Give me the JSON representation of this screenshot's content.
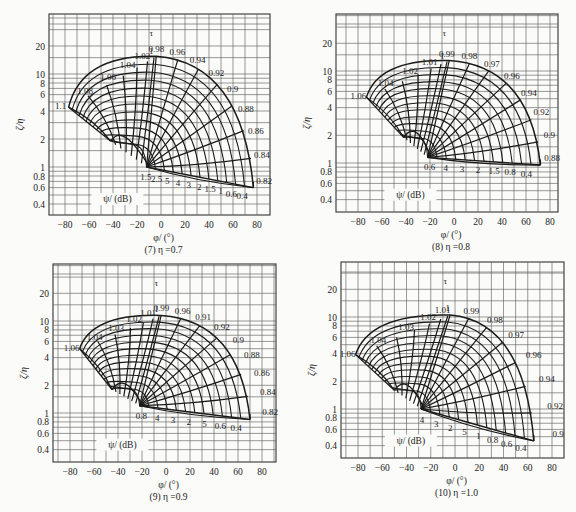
{
  "chart_data": [
    {
      "type": "nomogram",
      "title": "(7) η =0.7",
      "xlabel": "φ/ (°)",
      "ylabel": "ζ/η",
      "xticks": [
        -80,
        -60,
        -40,
        -20,
        0,
        20,
        40,
        60,
        80
      ],
      "yticks": [
        0.4,
        0.6,
        0.8,
        1,
        2,
        4,
        6,
        8,
        10,
        20
      ],
      "yscale": "log",
      "grid": true,
      "curve_family_label": "τ",
      "psi_label": "ψ/ (dB)",
      "tau_labels": [
        "1.1",
        "1.08",
        "1.06",
        "1.04",
        "1.02",
        "1",
        "0.98",
        "0.96",
        "0.94",
        "0.92",
        "0.9",
        "0.88",
        "0.86",
        "0.84",
        "0.82"
      ],
      "psi_labels": [
        "1.5",
        "2.5",
        "5",
        "4",
        "3",
        "2",
        "1.5",
        "1",
        "0.6",
        "0.4"
      ],
      "frame": {
        "x0": 49,
        "x1": 270,
        "y0": 14,
        "y1": 215
      },
      "xmap": {
        "v0": -80,
        "p0": 65,
        "v1": 80,
        "p1": 257
      },
      "ymap": {
        "v0": 1,
        "p0": 167,
        "per_decade": 93
      },
      "outer_arc": {
        "cx_deg": -2,
        "cy": 1.9,
        "top": 15.5,
        "left_deg": -77,
        "left_y": 4.4,
        "right_deg": 77,
        "right_y": 0.6
      },
      "inner_arc": {
        "left_deg": -42,
        "left_y": 1.9,
        "right_deg": -12,
        "right_y": 1.0
      },
      "bottom_edge": {
        "from_deg": -12,
        "from_y": 1.0,
        "to_deg": 77,
        "to_y": 0.6
      }
    },
    {
      "type": "nomogram",
      "title": "(8) η =0.8",
      "xlabel": "φ/ (°)",
      "ylabel": "ζ/η",
      "xticks": [
        -80,
        -60,
        -40,
        -20,
        0,
        20,
        40,
        60,
        80
      ],
      "yticks": [
        0.4,
        0.6,
        0.8,
        1,
        2,
        4,
        6,
        8,
        10,
        20
      ],
      "yscale": "log",
      "grid": true,
      "curve_family_label": "τ",
      "psi_label": "ψ/ (dB)",
      "tau_labels": [
        "1.06",
        "1.04",
        "1.02",
        "1.01",
        "1",
        "0.99",
        "0.98",
        "0.97",
        "0.96",
        "0.94",
        "0.92",
        "0.9",
        "0.88"
      ],
      "psi_labels": [
        "0.6",
        "4",
        "3",
        "2",
        "1.5",
        "0.8",
        "0.4"
      ],
      "frame": {
        "x0": 336,
        "x1": 558,
        "y0": 14,
        "y1": 212
      },
      "xmap": {
        "v0": -80,
        "p0": 358,
        "v1": 80,
        "p1": 550
      },
      "ymap": {
        "v0": 1,
        "p0": 163,
        "per_decade": 92
      },
      "outer_arc": {
        "top": 13,
        "left_deg": -73,
        "left_y": 5.2,
        "right_deg": 72,
        "right_y": 0.95
      },
      "inner_arc": {
        "left_deg": -42,
        "left_y": 1.9,
        "right_deg": -22,
        "right_y": 1.15
      },
      "bottom_edge": {
        "from_deg": -22,
        "from_y": 1.15,
        "to_deg": 72,
        "to_y": 0.95
      }
    },
    {
      "type": "nomogram",
      "title": "(9) η =0.9",
      "xlabel": "φ/ (°)",
      "ylabel": "ζ/η",
      "xticks": [
        -80,
        -60,
        -40,
        -20,
        0,
        20,
        40,
        60,
        80
      ],
      "yticks": [
        0.4,
        0.6,
        0.8,
        1,
        2,
        4,
        6,
        8,
        10,
        20
      ],
      "yscale": "log",
      "grid": true,
      "curve_family_label": "τ",
      "psi_label": "ψ/ (dB)",
      "tau_labels": [
        "1.06",
        "1.04",
        "1.03",
        "1.02",
        "1.01",
        "1",
        "0.99",
        "0.96",
        "0.91",
        "0.92",
        "0.9",
        "0.88",
        "0.86",
        "0.84",
        "0.82"
      ],
      "psi_labels": [
        "0.8",
        "4",
        "3",
        "2",
        "5",
        "0.6",
        "0.4"
      ],
      "frame": {
        "x0": 53,
        "x1": 276,
        "y0": 264,
        "y1": 462
      },
      "xmap": {
        "v0": -80,
        "p0": 70,
        "v1": 80,
        "p1": 262
      },
      "ymap": {
        "v0": 1,
        "p0": 413,
        "per_decade": 92
      },
      "outer_arc": {
        "top": 11.5,
        "left_deg": -72,
        "left_y": 5.0,
        "right_deg": 70,
        "right_y": 0.85
      },
      "inner_arc": {
        "left_deg": -45,
        "left_y": 1.8,
        "right_deg": -22,
        "right_y": 1.2
      },
      "bottom_edge": {
        "from_deg": -22,
        "from_y": 1.2,
        "to_deg": 70,
        "to_y": 0.85
      }
    },
    {
      "type": "nomogram",
      "title": "(10) η =1.0",
      "xlabel": "φ/ (°)",
      "ylabel": "ζ/η",
      "xticks": [
        -80,
        -60,
        -40,
        -20,
        0,
        20,
        40,
        60,
        80
      ],
      "yticks": [
        0.4,
        0.6,
        0.8,
        1,
        2,
        4,
        6,
        8,
        10,
        20
      ],
      "yscale": "log",
      "grid": true,
      "curve_family_label": "τ",
      "psi_label": "ψ/ (dB)",
      "tau_labels": [
        "1.06",
        "1.04",
        "1.03",
        "1.02",
        "1.01",
        "1",
        "0.99",
        "0.98",
        "0.97",
        "0.96",
        "0.94",
        "0.92",
        "0.9"
      ],
      "psi_labels": [
        "4",
        "3",
        "2",
        "5",
        "1",
        "0.8",
        "0.6",
        "0.4"
      ],
      "frame": {
        "x0": 341,
        "x1": 564,
        "y0": 262,
        "y1": 458
      },
      "xmap": {
        "v0": -80,
        "p0": 358,
        "v1": 80,
        "p1": 552
      },
      "ymap": {
        "v0": 1,
        "p0": 409,
        "per_decade": 92
      },
      "outer_arc": {
        "top": 10.5,
        "left_deg": -82,
        "left_y": 3.9,
        "right_deg": 65,
        "right_y": 0.45
      },
      "inner_arc": {
        "left_deg": -50,
        "left_y": 1.6,
        "right_deg": -28,
        "right_y": 1.0
      },
      "bottom_edge": {
        "from_deg": -28,
        "from_y": 1.0,
        "to_deg": 62,
        "to_y": 0.45
      }
    }
  ],
  "captions": [
    "(7) η =0.7",
    "(8) η =0.8",
    "(9) η =0.9",
    "(10) η =1.0"
  ],
  "axis": {
    "xlabel": "φ/ (°)",
    "ylabel": "ζ/η",
    "tau": "τ",
    "psi": "ψ/ (dB)"
  },
  "colors": {
    "line": "#1a1a1a",
    "grid": "#444444",
    "bg": "#fbfbf9"
  }
}
